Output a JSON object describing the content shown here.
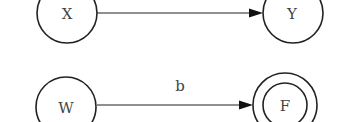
{
  "diagram": {
    "type": "state-machine",
    "nodes": [
      {
        "id": "X",
        "label": "X",
        "accepting": false
      },
      {
        "id": "Y",
        "label": "Y",
        "accepting": false
      },
      {
        "id": "W",
        "label": "W",
        "accepting": false
      },
      {
        "id": "F",
        "label": "F",
        "accepting": true
      }
    ],
    "edges": [
      {
        "from": "X",
        "to": "Y",
        "label": ""
      },
      {
        "from": "W",
        "to": "F",
        "label": "b"
      }
    ]
  }
}
